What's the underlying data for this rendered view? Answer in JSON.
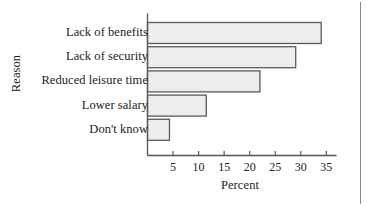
{
  "chart_data": {
    "type": "bar",
    "orientation": "horizontal",
    "title": "",
    "xlabel": "Percent",
    "ylabel": "Reason",
    "categories": [
      "Lack of benefits",
      "Lack of security",
      "Reduced leisure time",
      "Lower salary",
      "Don't know"
    ],
    "values": [
      34,
      29,
      22,
      11.5,
      4.3
    ],
    "xlim": [
      0,
      37
    ],
    "xticks": [
      5,
      10,
      15,
      20,
      25,
      30,
      35
    ],
    "xtick_labels": [
      "5",
      "10",
      "15",
      "20",
      "25",
      "30",
      "35"
    ],
    "grid": false,
    "legend": null,
    "bar_fill_color": "#ededed",
    "bar_edge_color": "#5a5a5a",
    "axis_color": "#555555"
  },
  "axes": {
    "y_title": "Reason",
    "x_title": "Percent"
  }
}
